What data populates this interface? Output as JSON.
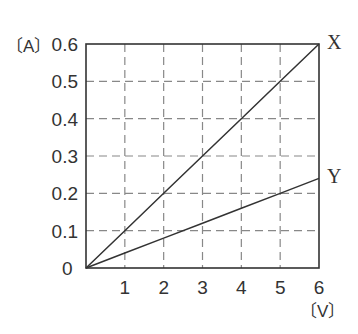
{
  "chart_data": {
    "type": "line",
    "title": "",
    "xlabel": "[V]",
    "ylabel": "[A]",
    "xlim": [
      0,
      6
    ],
    "ylim": [
      0,
      0.6
    ],
    "grid": true,
    "x_ticks": [
      "1",
      "2",
      "3",
      "4",
      "5",
      "6"
    ],
    "y_ticks": [
      "0",
      "0.1",
      "0.2",
      "0.3",
      "0.4",
      "0.5",
      "0.6"
    ],
    "origin_label": "0",
    "series": [
      {
        "name": "X",
        "x": [
          0,
          1,
          2,
          3,
          4,
          5,
          6
        ],
        "y": [
          0,
          0.1,
          0.2,
          0.3,
          0.4,
          0.5,
          0.6
        ]
      },
      {
        "name": "Y",
        "x": [
          0,
          1,
          2,
          3,
          4,
          5,
          6
        ],
        "y": [
          0,
          0.04,
          0.08,
          0.12,
          0.16,
          0.2,
          0.24
        ]
      }
    ],
    "legend": "inline labels at line ends"
  },
  "axes": {
    "y_unit": "〔A〕",
    "x_unit": "〔V〕"
  },
  "colors": {
    "line": "#333333",
    "grid": "#888888",
    "frame": "#333333"
  }
}
